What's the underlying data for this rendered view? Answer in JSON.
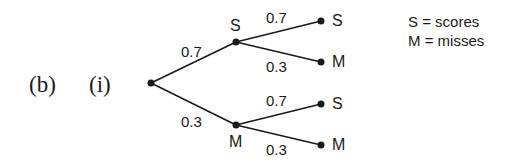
{
  "question": {
    "part": "(b)",
    "subpart": "(i)"
  },
  "tree": {
    "first_branches": [
      {
        "prob": "0.7",
        "outcome": "S"
      },
      {
        "prob": "0.3",
        "outcome": "M"
      }
    ],
    "second_branches": {
      "after_S": [
        {
          "prob": "0.7",
          "outcome": "S"
        },
        {
          "prob": "0.3",
          "outcome": "M"
        }
      ],
      "after_M": [
        {
          "prob": "0.7",
          "outcome": "S"
        },
        {
          "prob": "0.3",
          "outcome": "M"
        }
      ]
    }
  },
  "key": [
    "S = scores",
    "M = misses"
  ],
  "colors": {
    "ink": "#1a1a1a",
    "background": "#ffffff"
  }
}
